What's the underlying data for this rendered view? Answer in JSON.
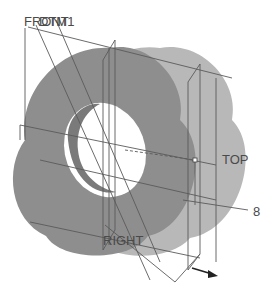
{
  "viewport": {
    "background": "#ffffff",
    "part_color": "#8c8c8c",
    "part_side_color": "#b4b4b4",
    "datum_color": "#5a5a5a"
  },
  "datums": {
    "front": "FRONT",
    "dtm1": "DTM1",
    "top": "TOP",
    "right": "RIGHT"
  },
  "annotations": {
    "callout_number": "8"
  },
  "icons": {
    "direction_arrow": "arrow-right-icon"
  }
}
